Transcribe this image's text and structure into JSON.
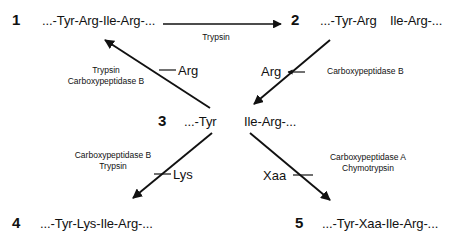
{
  "diagram": {
    "background_color": "#ffffff",
    "ink_color": "#111111",
    "steps": [
      {
        "id": "1",
        "number": "1",
        "sequence": "...-Tyr-Arg-Ile-Arg-..."
      },
      {
        "id": "2",
        "number": "2",
        "sequence_left": "...-Tyr-Arg",
        "sequence_right": "Ile-Arg-..."
      },
      {
        "id": "3",
        "number": "3",
        "sequence_left": "...-Tyr",
        "sequence_right": "Ile-Arg-..."
      },
      {
        "id": "4",
        "number": "4",
        "sequence": "...-Tyr-Lys-Ile-Arg-..."
      },
      {
        "id": "5",
        "number": "5",
        "sequence": "...-Tyr-Xaa-Ile-Arg-..."
      }
    ],
    "arrows": [
      {
        "id": "arrow-1-to-2",
        "kind": "horizontal",
        "from_step": "1",
        "to_step": "2",
        "enzymes": [
          "Trypsin"
        ],
        "released_residue": null
      },
      {
        "id": "arrow-3-to-1",
        "kind": "diagonal-up-left",
        "from_step": "3",
        "to_step": "1",
        "enzymes": [
          "Trypsin",
          "Carboxypeptidase B"
        ],
        "released_residue": "Arg"
      },
      {
        "id": "arrow-2-to-3",
        "kind": "diagonal-down-left",
        "from_step": "2",
        "to_step": "3",
        "enzymes": [
          "Carboxypeptidase B"
        ],
        "released_residue": "Arg"
      },
      {
        "id": "arrow-3-to-4",
        "kind": "diagonal-down-left",
        "from_step": "3",
        "to_step": "4",
        "enzymes": [
          "Carboxypeptidase B",
          "Trypsin"
        ],
        "released_residue": "Lys"
      },
      {
        "id": "arrow-3-to-5",
        "kind": "diagonal-down-right",
        "from_step": "3",
        "to_step": "5",
        "enzymes": [
          "Carboxypeptidase A",
          "Chymotrypsin"
        ],
        "released_residue": "Xaa"
      }
    ],
    "labels": {
      "trypsin": "Trypsin",
      "carboxypeptidase_b": "Carboxypeptidase B",
      "carboxypeptidase_a": "Carboxypeptidase A",
      "chymotrypsin": "Chymotrypsin",
      "arg": "Arg",
      "lys": "Lys",
      "xaa": "Xaa"
    }
  }
}
